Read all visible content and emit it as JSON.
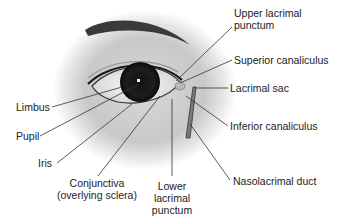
{
  "labels": {
    "upper_lacrimal_punctum": [
      "Upper lacrimal",
      "punctum"
    ],
    "superior_canaliculus": "Superior canaliculus",
    "lacrimal_sac": "Lacrimal sac",
    "inferior_canaliculus": "Inferior canaliculus",
    "nasolacrimal_duct": "Nasolacrimal duct",
    "limbus": "Limbus",
    "pupil": "Pupil",
    "iris": "Iris",
    "conjunctiva": [
      "Conjunctiva",
      "(overlying sclera)"
    ],
    "lower_lacrimal_punctum": [
      "Lower",
      "lacrimal",
      "punctum"
    ]
  }
}
